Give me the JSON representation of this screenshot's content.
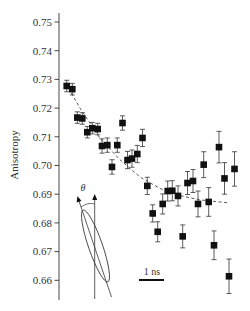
{
  "chart_data": {
    "type": "scatter",
    "title": "",
    "xlabel": "",
    "ylabel": "Anisotropy",
    "ylim": [
      0.655,
      0.753
    ],
    "yticks": [
      0.75,
      0.74,
      0.73,
      0.72,
      0.71,
      0.7,
      0.69,
      0.68,
      0.67,
      0.66
    ],
    "ytick_labels": [
      "0.75",
      "0.74",
      "0.73",
      "0.72",
      "0.71",
      "0.70",
      "0.69",
      "0.68",
      "0.67",
      "0.66"
    ],
    "grid": false,
    "legend": null,
    "x_index_note": "x is sequential measurement position (time); no x-axis ticks shown",
    "series": [
      {
        "name": "anisotropy",
        "marker": "square",
        "color": "#111111",
        "points": [
          {
            "x": 66.7,
            "y": 0.7277,
            "err": 0.002
          },
          {
            "x": 72.3,
            "y": 0.7266,
            "err": 0.002
          },
          {
            "x": 77.3,
            "y": 0.7167,
            "err": 0.002
          },
          {
            "x": 82.3,
            "y": 0.7164,
            "err": 0.002
          },
          {
            "x": 87.3,
            "y": 0.7116,
            "err": 0.002
          },
          {
            "x": 92.3,
            "y": 0.713,
            "err": 0.002
          },
          {
            "x": 97.7,
            "y": 0.7127,
            "err": 0.002
          },
          {
            "x": 102.0,
            "y": 0.7068,
            "err": 0.0025
          },
          {
            "x": 107.3,
            "y": 0.7071,
            "err": 0.0025
          },
          {
            "x": 112.0,
            "y": 0.6995,
            "err": 0.0025
          },
          {
            "x": 117.3,
            "y": 0.7071,
            "err": 0.0025
          },
          {
            "x": 122.5,
            "y": 0.7148,
            "err": 0.0025
          },
          {
            "x": 127.5,
            "y": 0.7019,
            "err": 0.003
          },
          {
            "x": 132.0,
            "y": 0.7024,
            "err": 0.003
          },
          {
            "x": 137.3,
            "y": 0.704,
            "err": 0.003
          },
          {
            "x": 142.5,
            "y": 0.7096,
            "err": 0.003
          },
          {
            "x": 147.3,
            "y": 0.6929,
            "err": 0.003
          },
          {
            "x": 152.7,
            "y": 0.6833,
            "err": 0.003
          },
          {
            "x": 157.7,
            "y": 0.6769,
            "err": 0.0035
          },
          {
            "x": 162.7,
            "y": 0.6866,
            "err": 0.0035
          },
          {
            "x": 167.7,
            "y": 0.6911,
            "err": 0.0035
          },
          {
            "x": 172.3,
            "y": 0.6912,
            "err": 0.0035
          },
          {
            "x": 178.0,
            "y": 0.6894,
            "err": 0.0035
          },
          {
            "x": 182.7,
            "y": 0.6753,
            "err": 0.004
          },
          {
            "x": 187.5,
            "y": 0.6939,
            "err": 0.004
          },
          {
            "x": 193.0,
            "y": 0.6946,
            "err": 0.004
          },
          {
            "x": 198.0,
            "y": 0.6866,
            "err": 0.0045
          },
          {
            "x": 203.7,
            "y": 0.7003,
            "err": 0.0045
          },
          {
            "x": 208.7,
            "y": 0.6873,
            "err": 0.005
          },
          {
            "x": 214.0,
            "y": 0.6722,
            "err": 0.005
          },
          {
            "x": 219.0,
            "y": 0.7064,
            "err": 0.0055
          },
          {
            "x": 224.5,
            "y": 0.6955,
            "err": 0.0055
          },
          {
            "x": 229.0,
            "y": 0.6614,
            "err": 0.006
          },
          {
            "x": 234.5,
            "y": 0.6988,
            "err": 0.006
          }
        ]
      },
      {
        "name": "fit",
        "type": "dashed-line",
        "color": "#444444",
        "points": [
          {
            "x": 66,
            "y": 0.7285
          },
          {
            "x": 80,
            "y": 0.72
          },
          {
            "x": 100,
            "y": 0.7095
          },
          {
            "x": 120,
            "y": 0.702
          },
          {
            "x": 140,
            "y": 0.696
          },
          {
            "x": 160,
            "y": 0.692
          },
          {
            "x": 180,
            "y": 0.6895
          },
          {
            "x": 200,
            "y": 0.688
          },
          {
            "x": 228,
            "y": 0.687
          }
        ]
      }
    ],
    "annotations": [
      {
        "type": "scale-bar",
        "label": "1 ns"
      },
      {
        "type": "inset-diagram",
        "label": "θ",
        "description": "tilted ellipse with vertical axis and tilted axis, angle theta between them"
      }
    ]
  },
  "labels": {
    "ylabel": "Anisotropy",
    "scale_bar": "1 ns",
    "theta": "θ"
  }
}
